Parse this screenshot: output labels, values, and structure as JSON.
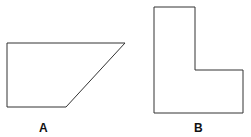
{
  "shapes": [
    {
      "label": "A",
      "type": "trapezoid",
      "points": "7,43 125,43 66,107 7,107"
    },
    {
      "label": "B",
      "type": "L-shape",
      "points": "154,7 195,7 195,70 243,70 243,113 154,113"
    }
  ],
  "stroke_color": "#333333"
}
